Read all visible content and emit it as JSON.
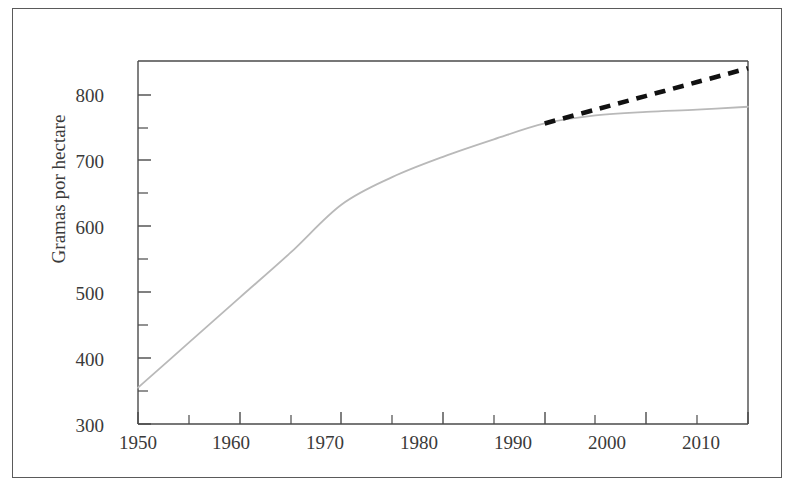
{
  "figure": {
    "background_color": "#ffffff",
    "frame_color": "#5a5a5a",
    "axis_color": "#4a4a4a"
  },
  "axis": {
    "y_title": "Gramas por hectare",
    "y_ticks": [
      "300",
      "400",
      "500",
      "600",
      "700",
      "800"
    ],
    "x_ticks": [
      "1950",
      "1960",
      "1970",
      "1980",
      "1990",
      "2000",
      "2010"
    ]
  },
  "chart_data": {
    "type": "line",
    "title": "",
    "xlabel": "",
    "ylabel": "Gramas por hectare",
    "xlim": [
      1950,
      2010
    ],
    "ylim": [
      300,
      800
    ],
    "x_major_ticks": [
      1950,
      1960,
      1970,
      1980,
      1990,
      2000,
      2010
    ],
    "x_minor_ticks": [
      1955,
      1965,
      1975,
      1985,
      1995,
      2005
    ],
    "y_major_ticks": [
      300,
      400,
      500,
      600,
      700,
      800
    ],
    "y_minor_ticks": [
      350,
      450,
      550,
      650,
      750
    ],
    "grid": false,
    "legend": "none",
    "series": [
      {
        "name": "historical",
        "style": "solid",
        "color": "#b9b9b9",
        "x": [
          1950,
          1955,
          1960,
          1965,
          1970,
          1975,
          1980,
          1985,
          1990,
          1995,
          2000,
          2005,
          2010
        ],
        "values": [
          350,
          412,
          474,
          536,
          602,
          640,
          668,
          692,
          714,
          725,
          730,
          733,
          737
        ]
      },
      {
        "name": "projection",
        "style": "dashed",
        "color": "#111111",
        "x": [
          1990,
          1995,
          2000,
          2005,
          2010
        ],
        "values": [
          714,
          733,
          752,
          771,
          790
        ]
      }
    ]
  }
}
